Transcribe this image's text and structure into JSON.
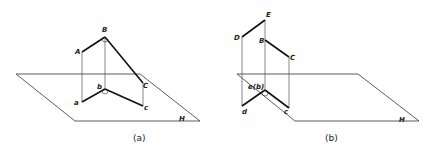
{
  "figures": [
    {
      "caption": "(a)",
      "plane_label": "H",
      "points": {
        "A": "A",
        "B": "B",
        "C": "C",
        "a": "a",
        "b": "b",
        "c": "c"
      }
    },
    {
      "caption": "(b)",
      "plane_label": "H",
      "points": {
        "D": "D",
        "E": "E",
        "B": "B",
        "C": "C",
        "d": "d",
        "eb": "e(b)",
        "c": "c"
      }
    }
  ]
}
